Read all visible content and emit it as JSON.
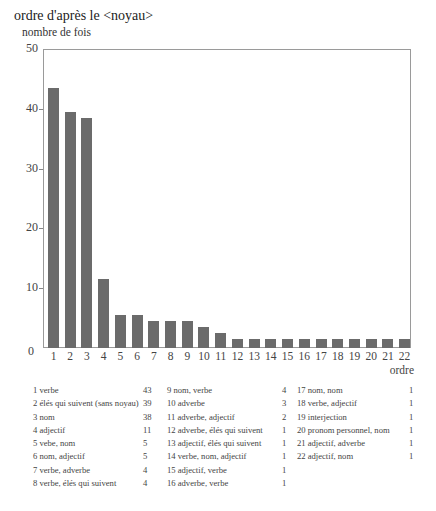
{
  "chart_data": {
    "type": "bar",
    "title": "ordre d'après le <noyau>",
    "ylabel": "nombre de fois",
    "xlabel": "ordre",
    "ylim": [
      0,
      50
    ],
    "yticks": [
      "0",
      "10",
      "20",
      "30",
      "40",
      "50"
    ],
    "grid": false,
    "categories": [
      "1",
      "2",
      "3",
      "4",
      "5",
      "6",
      "7",
      "8",
      "9",
      "10",
      "11",
      "12",
      "13",
      "14",
      "15",
      "16",
      "17",
      "18",
      "19",
      "20",
      "21",
      "22"
    ],
    "values": [
      43,
      39,
      38,
      11,
      5,
      5,
      4,
      4,
      4,
      3,
      2,
      1,
      1,
      1,
      1,
      1,
      1,
      1,
      1,
      1,
      1,
      1
    ],
    "bar_color": "#6b6b6b",
    "legend": [
      {
        "n": "1",
        "label": "verbe",
        "value": "43"
      },
      {
        "n": "2",
        "label": "élés qui suivent (sans noyau)",
        "value": "39"
      },
      {
        "n": "3",
        "label": "nom",
        "value": "38"
      },
      {
        "n": "4",
        "label": "adjectif",
        "value": "11"
      },
      {
        "n": "5",
        "label": "vebe, nom",
        "value": "5"
      },
      {
        "n": "6",
        "label": "nom, adjectif",
        "value": "5"
      },
      {
        "n": "7",
        "label": "verbe, adverbe",
        "value": "4"
      },
      {
        "n": "8",
        "label": "verbe, élés qui suivent",
        "value": "4"
      },
      {
        "n": "9",
        "label": "nom, verbe",
        "value": "4"
      },
      {
        "n": "10",
        "label": "adverbe",
        "value": "3"
      },
      {
        "n": "11",
        "label": "adverbe, adjectif",
        "value": "2"
      },
      {
        "n": "12",
        "label": "adverbe, élés qui suivent",
        "value": "1"
      },
      {
        "n": "13",
        "label": "adjectif, élés qui suivent",
        "value": "1"
      },
      {
        "n": "14",
        "label": "verbe, nom, adjectif",
        "value": "1"
      },
      {
        "n": "15",
        "label": "adjectif, verbe",
        "value": "1"
      },
      {
        "n": "16",
        "label": "adverbe, verbe",
        "value": "1"
      },
      {
        "n": "17",
        "label": "nom, nom",
        "value": "1"
      },
      {
        "n": "18",
        "label": "verbe, adjectif",
        "value": "1"
      },
      {
        "n": "19",
        "label": "interjection",
        "value": "1"
      },
      {
        "n": "20",
        "label": "pronom personnel, nom",
        "value": "1"
      },
      {
        "n": "21",
        "label": "adjectif, adverbe",
        "value": "1"
      },
      {
        "n": "22",
        "label": "adjectif, nom",
        "value": "1"
      }
    ]
  }
}
